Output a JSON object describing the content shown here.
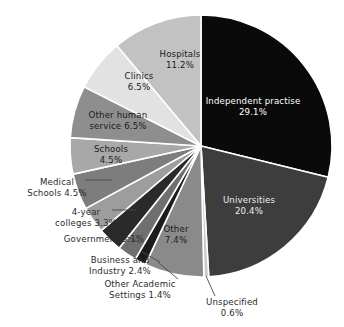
{
  "chart_data": {
    "type": "pie",
    "title": "",
    "subtitle": "",
    "xlabel": "",
    "ylabel": "",
    "legend_position": "none",
    "grid": false,
    "start_angle_deg": 0,
    "direction": "clockwise",
    "units": "percent",
    "categories": [
      "Independent practise",
      "Universities",
      "Unspecified",
      "Other",
      "Other Academic Settings",
      "Business and Industry",
      "Government",
      "4-year colleges",
      "Medical Schools",
      "Schools",
      "Other human service",
      "Clinics",
      "Hospitals"
    ],
    "values": [
      29.1,
      20.4,
      0.6,
      7.4,
      1.4,
      2.4,
      3.1,
      3.3,
      4.5,
      4.5,
      6.5,
      6.5,
      11.2
    ],
    "colors": [
      "#0a0a0a",
      "#3d3d3d",
      "#c9c9c9",
      "#8a8a8a",
      "#1c1c1c",
      "#6f6f6f",
      "#2a2a2a",
      "#9d9d9d",
      "#7d7d7d",
      "#a8a8a8",
      "#8e8e8e",
      "#e2e2e2",
      "#c2c2c2"
    ],
    "slices": [
      {
        "name": "Independent practise",
        "label_line1": "Independent practise",
        "label_line2": "29.1%",
        "value": 29.1,
        "color": "#0a0a0a",
        "label_placement": "inside",
        "label_color": "#ffffff",
        "label_x": 253,
        "label_y": 104
      },
      {
        "name": "Universities",
        "label_line1": "Universities",
        "label_line2": "20.4%",
        "value": 20.4,
        "color": "#3d3d3d",
        "label_placement": "inside",
        "label_color": "#ededed",
        "label_x": 249,
        "label_y": 203
      },
      {
        "name": "Unspecified",
        "label_line1": "Unspecified",
        "label_line2": "0.6%",
        "value": 0.6,
        "color": "#c9c9c9",
        "label_placement": "outside",
        "label_color": "#2b2b2b",
        "label_x": 232,
        "label_y": 305
      },
      {
        "name": "Other",
        "label_line1": "Other",
        "label_line2": "7.4%",
        "value": 7.4,
        "color": "#8a8a8a",
        "label_placement": "inside",
        "label_color": "#1a1a1a",
        "label_x": 176,
        "label_y": 232
      },
      {
        "name": "Other Academic Settings",
        "label_line1": "Other Academic",
        "label_line2": "Settings 1.4%",
        "value": 1.4,
        "color": "#1c1c1c",
        "label_placement": "outside",
        "label_color": "#2b2b2b",
        "label_x": 140,
        "label_y": 287
      },
      {
        "name": "Business and Industry",
        "label_line1": "Business and",
        "label_line2": "Industry 2.4%",
        "value": 2.4,
        "color": "#6f6f6f",
        "label_placement": "outside",
        "label_color": "#2b2b2b",
        "label_x": 120,
        "label_y": 263
      },
      {
        "name": "Government",
        "label_line1": "Government 3.1%",
        "label_line2": "",
        "value": 3.1,
        "color": "#2a2a2a",
        "label_placement": "outside",
        "label_color": "#2b2b2b",
        "label_x": 104,
        "label_y": 242
      },
      {
        "name": "4-year colleges",
        "label_line1": "4-year",
        "label_line2": "colleges 3.3%",
        "value": 3.3,
        "color": "#9d9d9d",
        "label_placement": "outside",
        "label_color": "#2b2b2b",
        "label_x": 86,
        "label_y": 215
      },
      {
        "name": "Medical Schools",
        "label_line1": "Medical",
        "label_line2": "Schools 4.5%",
        "value": 4.5,
        "color": "#7d7d7d",
        "label_placement": "outside",
        "label_color": "#2b2b2b",
        "label_x": 57,
        "label_y": 185
      },
      {
        "name": "Schools",
        "label_line1": "Schools",
        "label_line2": "4.5%",
        "value": 4.5,
        "color": "#a8a8a8",
        "label_placement": "inside",
        "label_color": "#1a1a1a",
        "label_x": 111,
        "label_y": 152
      },
      {
        "name": "Other human service",
        "label_line1": "Other human",
        "label_line2": "service 6.5%",
        "value": 6.5,
        "color": "#8e8e8e",
        "label_placement": "inside",
        "label_color": "#1a1a1a",
        "label_x": 118,
        "label_y": 118
      },
      {
        "name": "Clinics",
        "label_line1": "Clinics",
        "label_line2": "6.5%",
        "value": 6.5,
        "color": "#e2e2e2",
        "label_placement": "inside",
        "label_color": "#1a1a1a",
        "label_x": 139,
        "label_y": 79
      },
      {
        "name": "Hospitals",
        "label_line1": "Hospitals",
        "label_line2": "11.2%",
        "value": 11.2,
        "color": "#c2c2c2",
        "label_placement": "inside",
        "label_color": "#1a1a1a",
        "label_x": 180,
        "label_y": 57
      }
    ],
    "geometry": {
      "center_x": 201,
      "center_y": 146,
      "radius": 131,
      "separator_color": "#ffffff",
      "separator_width": 1.6
    },
    "leaders": [
      {
        "name": "unspecified-leader",
        "x1": 206,
        "y1": 276,
        "x2": 215,
        "y2": 296
      },
      {
        "name": "other-academic-leader",
        "x1": 158,
        "y1": 262,
        "x2": 178,
        "y2": 279
      },
      {
        "name": "business-industry-leader",
        "x1": 142,
        "y1": 252,
        "x2": 160,
        "y2": 262
      },
      {
        "name": "government-leader",
        "x1": 125,
        "y1": 236,
        "x2": 141,
        "y2": 243
      },
      {
        "name": "4year-colleges-leader",
        "x1": 112,
        "y1": 210,
        "x2": 136,
        "y2": 210
      },
      {
        "name": "medical-schools-leader",
        "x1": 85,
        "y1": 180,
        "x2": 112,
        "y2": 180
      }
    ]
  }
}
